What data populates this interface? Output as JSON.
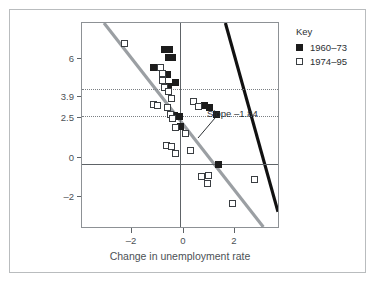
{
  "figure": {
    "background": "#ffffff",
    "frame_color": "#b9bcbe"
  },
  "legend": {
    "title": "Key",
    "position": "top-right-outside",
    "entries": [
      {
        "label": "1960–73",
        "marker": "filled-square",
        "color": "#1c1c1c"
      },
      {
        "label": "1974–95",
        "marker": "open-square",
        "color": "#3a3e42"
      }
    ]
  },
  "annotations": [
    {
      "text": "Slope –1.84",
      "name": "slope-annotation"
    }
  ],
  "axes": {
    "ylabel": "GDP growth (in %)",
    "xlabel": "Change in unemployment rate",
    "yticks": [
      "6",
      "3.9",
      "2.5",
      "0",
      "–2"
    ],
    "ytick_values": [
      6,
      3.9,
      2.5,
      0,
      -2
    ],
    "xticks": [
      "–2",
      "0",
      "2"
    ],
    "xtick_values": [
      -2,
      0,
      2
    ]
  },
  "chart_data": {
    "type": "scatter",
    "title": "",
    "subtitle": "",
    "xlabel": "Change in unemployment rate",
    "ylabel": "GDP growth (in %)",
    "xlim": [
      -3.85,
      3.9
    ],
    "ylim": [
      -3.4,
      7.35
    ],
    "xticks": [
      -2,
      0,
      2
    ],
    "yticks": [
      -2,
      0,
      2.5,
      3.9,
      6
    ],
    "grid": "dotted horizontal reference lines at y = 2.5 and y = 3.9; solid axis lines at x = 0 and y = 0",
    "legend_position": "outside top right",
    "annotations": [
      {
        "text": "Slope –1.84",
        "x": 1.0,
        "y": 1.55,
        "points_to": {
          "x": 0.55,
          "y": 0.7
        },
        "series": "1960–73"
      }
    ],
    "series": [
      {
        "name": "1960–73",
        "marker": "filled-square",
        "color": "#1c1c1c",
        "points": [
          {
            "x": -0.62,
            "y": 5.95
          },
          {
            "x": -0.42,
            "y": 5.95
          },
          {
            "x": -0.46,
            "y": 5.55
          },
          {
            "x": -0.3,
            "y": 5.55
          },
          {
            "x": -1.05,
            "y": 5.05
          },
          {
            "x": -0.88,
            "y": 5.05
          },
          {
            "x": -0.52,
            "y": 4.65
          },
          {
            "x": -0.48,
            "y": 4.05
          },
          {
            "x": -0.18,
            "y": 4.25
          },
          {
            "x": 0.95,
            "y": 3.05
          },
          {
            "x": 1.15,
            "y": 2.95
          },
          {
            "x": 1.4,
            "y": 2.6
          },
          {
            "x": -0.22,
            "y": 2.5
          },
          {
            "x": -0.05,
            "y": 2.48
          },
          {
            "x": 0.02,
            "y": 1.95
          },
          {
            "x": 1.48,
            "y": -0.05
          }
        ]
      },
      {
        "name": "1974–95",
        "marker": "open-square",
        "color": "#3a3e42",
        "points": [
          {
            "x": -2.2,
            "y": 6.3
          },
          {
            "x": -0.78,
            "y": 5.05
          },
          {
            "x": -0.7,
            "y": 4.7
          },
          {
            "x": -0.68,
            "y": 4.35
          },
          {
            "x": -0.62,
            "y": 4.0
          },
          {
            "x": -0.45,
            "y": 3.75
          },
          {
            "x": -0.36,
            "y": 3.4
          },
          {
            "x": -1.05,
            "y": 3.1
          },
          {
            "x": -0.88,
            "y": 3.05
          },
          {
            "x": -0.52,
            "y": 2.95
          },
          {
            "x": -0.4,
            "y": 2.55
          },
          {
            "x": -0.3,
            "y": 2.35
          },
          {
            "x": 0.52,
            "y": 3.25
          },
          {
            "x": 0.72,
            "y": 3.0
          },
          {
            "x": -0.18,
            "y": 1.9
          },
          {
            "x": 0.2,
            "y": 1.6
          },
          {
            "x": -0.55,
            "y": 0.95
          },
          {
            "x": -0.35,
            "y": 0.92
          },
          {
            "x": -0.18,
            "y": 0.55
          },
          {
            "x": 0.38,
            "y": 0.68
          },
          {
            "x": 0.82,
            "y": -0.68
          },
          {
            "x": 1.12,
            "y": -0.6
          },
          {
            "x": 1.05,
            "y": -1.05
          },
          {
            "x": 2.9,
            "y": -0.8
          },
          {
            "x": 2.05,
            "y": -2.05
          }
        ]
      }
    ],
    "fit_lines": [
      {
        "name": "1960–73 fit",
        "slope": -1.84,
        "color": "#111111",
        "width_px": 3.2,
        "x_start": 1.82,
        "y_start": 7.35,
        "x_end": 3.9,
        "y_end": -2.6,
        "label": "Slope –1.84"
      },
      {
        "name": "1974–95 fit",
        "slope": -1.84,
        "color": "#9b9fa3",
        "width_px": 3.2,
        "x_start": -2.98,
        "y_start": 7.35,
        "x_end": 3.32,
        "y_end": -3.4
      }
    ]
  }
}
